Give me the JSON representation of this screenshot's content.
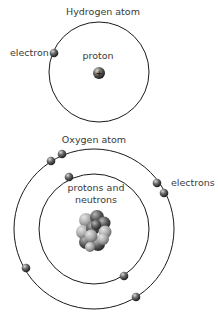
{
  "hydrogen": {
    "title": "Hydrogen atom",
    "electron_label": "electron",
    "nucleus_label": "proton",
    "nucleus_sign": "+",
    "orbit": {
      "cx": 99,
      "cy": 72,
      "r": 50
    },
    "nucleus": {
      "cx": 99,
      "cy": 73,
      "r": 6
    },
    "electrons": [
      {
        "cx": 54,
        "cy": 53
      }
    ]
  },
  "oxygen": {
    "title": "Oxygen atom",
    "electron_label": "electrons",
    "nucleus_label_line1": "protons and",
    "nucleus_label_line2": "neutrons",
    "inner_orbit": {
      "cx": 94,
      "cy": 229,
      "r": 55
    },
    "outer_orbit": {
      "cx": 94,
      "cy": 229,
      "r": 80
    },
    "electrons": [
      {
        "cx": 51,
        "cy": 161
      },
      {
        "cx": 62,
        "cy": 154
      },
      {
        "cx": 69,
        "cy": 177
      },
      {
        "cx": 157,
        "cy": 183
      },
      {
        "cx": 164,
        "cy": 193
      },
      {
        "cx": 26,
        "cy": 268
      },
      {
        "cx": 124,
        "cy": 276
      },
      {
        "cx": 136,
        "cy": 297
      }
    ]
  },
  "colors": {
    "line": "#1a1a1a",
    "text": "#3a3a3a",
    "particle_dark": "#2a2a2a",
    "particle_light": "#9a9a9a"
  }
}
